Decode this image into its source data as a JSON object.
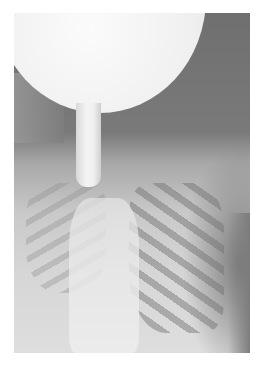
{
  "image": {
    "description": "Grayscale chest radiograph with a large bright bulb-shaped radiopaque object at top connected to a narrow tube extending down toward the upper chest",
    "colors": {
      "background": "#ffffff",
      "bulb": "#f2f2f2",
      "soft_tissue_dark": "#747474",
      "chest_light": "#d6d6d6"
    }
  }
}
